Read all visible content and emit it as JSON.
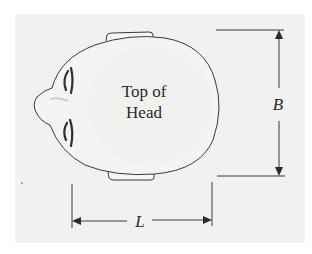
{
  "figure": {
    "head_label_line1": "Top of",
    "head_label_line2": "Head",
    "breadth_label": "B",
    "length_label": "L"
  },
  "colors": {
    "panel_background": "#f1f1f0",
    "stroke": "#3a3a3a",
    "text": "#2a2a2a"
  }
}
